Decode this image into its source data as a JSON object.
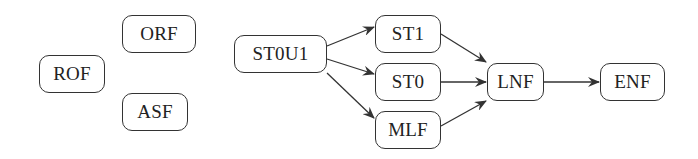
{
  "diagram": {
    "type": "flowchart",
    "colors": {
      "stroke": "#333333",
      "text": "#222222",
      "background": "#ffffff"
    },
    "nodes": [
      {
        "id": "ROF",
        "label": "ROF",
        "x": 39,
        "y": 55,
        "w": 66,
        "h": 38
      },
      {
        "id": "ORF",
        "label": "ORF",
        "x": 122,
        "y": 15,
        "w": 74,
        "h": 38
      },
      {
        "id": "ASF",
        "label": "ASF",
        "x": 122,
        "y": 93,
        "w": 66,
        "h": 38
      },
      {
        "id": "ST0U1",
        "label": "ST0U1",
        "x": 234,
        "y": 35,
        "w": 93,
        "h": 38
      },
      {
        "id": "ST1",
        "label": "ST1",
        "x": 375,
        "y": 15,
        "w": 66,
        "h": 38
      },
      {
        "id": "ST0",
        "label": "ST0",
        "x": 375,
        "y": 63,
        "w": 66,
        "h": 38
      },
      {
        "id": "MLF",
        "label": "MLF",
        "x": 375,
        "y": 111,
        "w": 66,
        "h": 38
      },
      {
        "id": "LNF",
        "label": "LNF",
        "x": 487,
        "y": 63,
        "w": 57,
        "h": 38
      },
      {
        "id": "ENF",
        "label": "ENF",
        "x": 600,
        "y": 63,
        "w": 65,
        "h": 38
      }
    ],
    "edges": [
      {
        "from": "ST0U1",
        "to": "ST1"
      },
      {
        "from": "ST0U1",
        "to": "ST0"
      },
      {
        "from": "ST0U1",
        "to": "MLF"
      },
      {
        "from": "ST1",
        "to": "LNF"
      },
      {
        "from": "ST0",
        "to": "LNF"
      },
      {
        "from": "MLF",
        "to": "LNF"
      },
      {
        "from": "LNF",
        "to": "ENF"
      }
    ]
  }
}
